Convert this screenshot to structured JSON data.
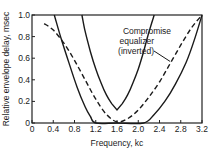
{
  "chart_data": {
    "type": "line",
    "title": "",
    "xlabel": "Frequency, kc",
    "ylabel": "Relative envelope delay, msec",
    "xlim": [
      0,
      3.2
    ],
    "ylim": [
      0,
      1.0
    ],
    "xticks": [
      "0",
      "0.4",
      "0.8",
      "1.2",
      "1.6",
      "2.0",
      "2.4",
      "2.8",
      "3.2"
    ],
    "yticks": [
      "0",
      "0.2",
      "0.4",
      "0.6",
      "0.8",
      "1.0"
    ],
    "grid": false,
    "legend": null,
    "annotations": [
      {
        "text": [
          "Compromise",
          "equalizer",
          "(inverted)"
        ],
        "points_to_series": "Compromise equalizer (inverted)",
        "at": [
          2.6,
          0.57
        ]
      }
    ],
    "series": [
      {
        "name": "Outer delay curve",
        "style": "solid",
        "x": [
          0.42,
          0.55,
          0.7,
          0.85,
          1.0,
          1.1,
          1.2,
          1.6,
          2.1,
          2.3,
          2.5,
          2.7,
          2.9,
          3.05,
          3.2
        ],
        "y": [
          1.0,
          0.78,
          0.55,
          0.33,
          0.15,
          0.06,
          0.0,
          0.0,
          0.0,
          0.08,
          0.2,
          0.36,
          0.56,
          0.76,
          1.0
        ]
      },
      {
        "name": "Inner delay curve",
        "style": "solid",
        "x": [
          0.94,
          1.0,
          1.1,
          1.2,
          1.3,
          1.4,
          1.5,
          1.6,
          1.7,
          1.8,
          1.9,
          2.0,
          2.1,
          2.2,
          2.3
        ],
        "y": [
          1.0,
          0.85,
          0.66,
          0.5,
          0.37,
          0.26,
          0.18,
          0.12,
          0.18,
          0.26,
          0.37,
          0.5,
          0.66,
          0.84,
          1.0
        ]
      },
      {
        "name": "Compromise equalizer (inverted)",
        "style": "dashed",
        "x": [
          0.23,
          0.4,
          0.6,
          0.8,
          1.0,
          1.2,
          1.4,
          1.6,
          1.8,
          2.0,
          2.2,
          2.4,
          2.6,
          2.8,
          3.0,
          3.2
        ],
        "y": [
          0.92,
          0.86,
          0.74,
          0.58,
          0.4,
          0.22,
          0.08,
          0.01,
          0.04,
          0.12,
          0.24,
          0.38,
          0.55,
          0.72,
          0.88,
          1.0
        ]
      }
    ]
  }
}
